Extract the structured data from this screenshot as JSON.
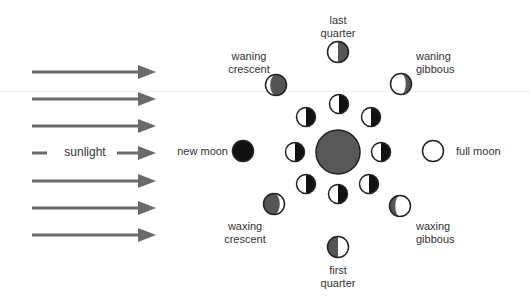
{
  "diagram": {
    "sunlight_label": "sunlight",
    "colors": {
      "arrow": "#6a6a6a",
      "earth_fill": "#585858",
      "moon_dark": "#111111",
      "moon_shadow_grey": "#555555",
      "moon_light": "#ffffff",
      "outline": "#222222",
      "text": "#333333"
    },
    "arrows_y": [
      72,
      99,
      126,
      153,
      181,
      208,
      235
    ],
    "earth": {
      "cx": 338,
      "cy": 152,
      "r": 22
    },
    "inner_orbit": [
      {
        "cx": 339,
        "cy": 104
      },
      {
        "cx": 371,
        "cy": 117
      },
      {
        "cx": 381,
        "cy": 152
      },
      {
        "cx": 369,
        "cy": 184
      },
      {
        "cx": 338,
        "cy": 194
      },
      {
        "cx": 306,
        "cy": 184
      },
      {
        "cx": 295,
        "cy": 152
      },
      {
        "cx": 306,
        "cy": 117
      }
    ],
    "phases": [
      {
        "id": "new-moon",
        "label": "new moon",
        "cx": 243,
        "cy": 151,
        "type": "new"
      },
      {
        "id": "waxing-crescent",
        "label": "waxing\ncrescent",
        "cx": 274,
        "cy": 204,
        "type": "waxing-crescent"
      },
      {
        "id": "first-quarter",
        "label": "first\nquarter",
        "cx": 338,
        "cy": 247,
        "type": "first-quarter"
      },
      {
        "id": "waxing-gibbous",
        "label": "waxing\ngibbous",
        "cx": 400,
        "cy": 206,
        "type": "waxing-gibbous"
      },
      {
        "id": "full-moon",
        "label": "full moon",
        "cx": 433,
        "cy": 151,
        "type": "full"
      },
      {
        "id": "waning-gibbous",
        "label": "waning\ngibbous",
        "cx": 401,
        "cy": 84,
        "type": "waning-gibbous"
      },
      {
        "id": "last-quarter",
        "label": "last\nquarter",
        "cx": 338,
        "cy": 52,
        "type": "last-quarter"
      },
      {
        "id": "waning-crescent",
        "label": "waning\ncrescent",
        "cx": 276,
        "cy": 85,
        "type": "waning-crescent"
      }
    ],
    "labels": {
      "new_moon": "new moon",
      "full_moon": "full moon",
      "last_quarter_1": "last",
      "last_quarter_2": "quarter",
      "first_quarter_1": "first",
      "first_quarter_2": "quarter",
      "waning_crescent_1": "waning",
      "waning_crescent_2": "crescent",
      "waning_gibbous_1": "waning",
      "waning_gibbous_2": "gibbous",
      "waxing_crescent_1": "waxing",
      "waxing_crescent_2": "crescent",
      "waxing_gibbous_1": "waxing",
      "waxing_gibbous_2": "gibbous"
    }
  }
}
